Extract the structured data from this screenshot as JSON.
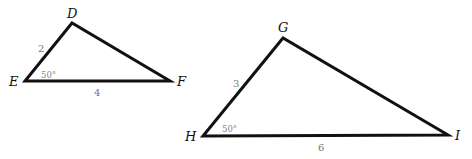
{
  "diagram": {
    "colors": {
      "edge": "#111111",
      "side_label": "#777777",
      "angle_label": "#888888",
      "background": "#ffffff"
    },
    "triangles": [
      {
        "name": "DEF",
        "vertices": {
          "D": {
            "label": "D",
            "x": 72,
            "y": 23
          },
          "E": {
            "label": "E",
            "x": 25,
            "y": 81
          },
          "F": {
            "label": "F",
            "x": 170,
            "y": 81
          }
        },
        "sides": {
          "DE": {
            "label": "2"
          },
          "EF": {
            "label": "4"
          }
        },
        "angle": {
          "vertex": "E",
          "label": "50°"
        }
      },
      {
        "name": "GHI",
        "vertices": {
          "G": {
            "label": "G",
            "x": 283,
            "y": 38
          },
          "H": {
            "label": "H",
            "x": 203,
            "y": 136
          },
          "I": {
            "label": "I",
            "x": 448,
            "y": 135
          }
        },
        "sides": {
          "GH": {
            "label": "3"
          },
          "HI": {
            "label": "6"
          }
        },
        "angle": {
          "vertex": "H",
          "label": "50°"
        }
      }
    ]
  }
}
